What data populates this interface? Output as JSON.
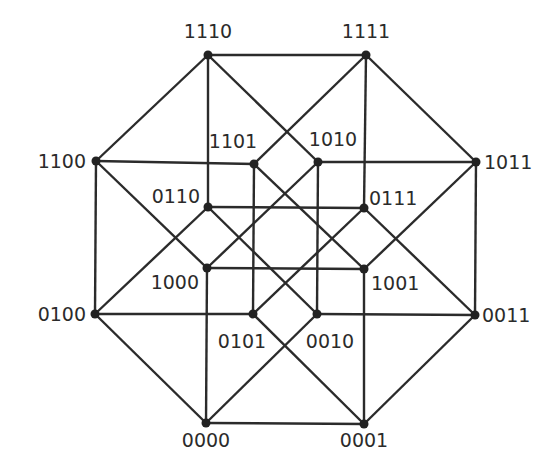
{
  "diagram": {
    "colors": {
      "edge": "#2b2b2b",
      "node": "#222222",
      "label": "#2b2b2b",
      "background": "#ffffff"
    },
    "nodes": [
      {
        "id": "1110",
        "x": 208,
        "y": 55,
        "lx": 208,
        "ly": 38,
        "anchor": "middle"
      },
      {
        "id": "1111",
        "x": 366,
        "y": 55,
        "lx": 366,
        "ly": 38,
        "anchor": "middle"
      },
      {
        "id": "1100",
        "x": 96,
        "y": 161,
        "lx": 86,
        "ly": 168,
        "anchor": "end"
      },
      {
        "id": "1011",
        "x": 476,
        "y": 162,
        "lx": 484,
        "ly": 169,
        "anchor": "start"
      },
      {
        "id": "1101",
        "x": 254,
        "y": 164,
        "lx": 233,
        "ly": 148,
        "anchor": "middle"
      },
      {
        "id": "1010",
        "x": 318,
        "y": 162,
        "lx": 333,
        "ly": 146,
        "anchor": "middle"
      },
      {
        "id": "0110",
        "x": 208,
        "y": 207,
        "lx": 200,
        "ly": 203,
        "anchor": "end"
      },
      {
        "id": "0111",
        "x": 364,
        "y": 208,
        "lx": 369,
        "ly": 205,
        "anchor": "start"
      },
      {
        "id": "1000",
        "x": 207,
        "y": 268,
        "lx": 199,
        "ly": 289,
        "anchor": "end"
      },
      {
        "id": "1001",
        "x": 364,
        "y": 269,
        "lx": 371,
        "ly": 290,
        "anchor": "start"
      },
      {
        "id": "0100",
        "x": 95,
        "y": 314,
        "lx": 86,
        "ly": 321,
        "anchor": "end"
      },
      {
        "id": "0011",
        "x": 475,
        "y": 315,
        "lx": 482,
        "ly": 322,
        "anchor": "start"
      },
      {
        "id": "0101",
        "x": 253,
        "y": 314,
        "lx": 242,
        "ly": 348,
        "anchor": "middle"
      },
      {
        "id": "0010",
        "x": 317,
        "y": 314,
        "lx": 330,
        "ly": 348,
        "anchor": "middle"
      },
      {
        "id": "0000",
        "x": 206,
        "y": 423,
        "lx": 206,
        "ly": 447,
        "anchor": "middle"
      },
      {
        "id": "0001",
        "x": 364,
        "y": 424,
        "lx": 364,
        "ly": 447,
        "anchor": "middle"
      }
    ],
    "edges": [
      [
        "0000",
        "0001"
      ],
      [
        "0000",
        "0010"
      ],
      [
        "0000",
        "0100"
      ],
      [
        "0000",
        "1000"
      ],
      [
        "0001",
        "0011"
      ],
      [
        "0001",
        "0101"
      ],
      [
        "0001",
        "1001"
      ],
      [
        "0010",
        "0011"
      ],
      [
        "0010",
        "0110"
      ],
      [
        "0010",
        "1010"
      ],
      [
        "0011",
        "0111"
      ],
      [
        "0011",
        "1011"
      ],
      [
        "0100",
        "0101"
      ],
      [
        "0100",
        "0110"
      ],
      [
        "0100",
        "1100"
      ],
      [
        "0101",
        "0111"
      ],
      [
        "0101",
        "1101"
      ],
      [
        "0110",
        "0111"
      ],
      [
        "0110",
        "1110"
      ],
      [
        "0111",
        "1111"
      ],
      [
        "1000",
        "1001"
      ],
      [
        "1000",
        "1010"
      ],
      [
        "1000",
        "1100"
      ],
      [
        "1001",
        "1011"
      ],
      [
        "1001",
        "1101"
      ],
      [
        "1010",
        "1011"
      ],
      [
        "1010",
        "1110"
      ],
      [
        "1011",
        "1111"
      ],
      [
        "1100",
        "1101"
      ],
      [
        "1100",
        "1110"
      ],
      [
        "1101",
        "1111"
      ],
      [
        "1110",
        "1111"
      ]
    ]
  }
}
